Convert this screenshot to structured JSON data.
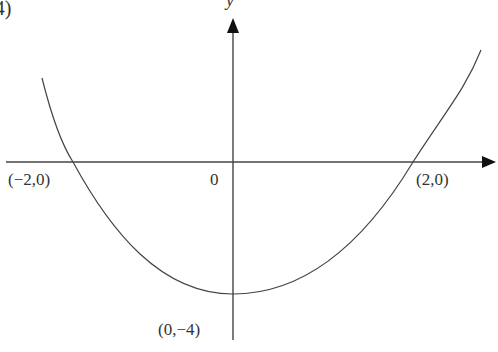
{
  "figure": {
    "part_label": "(4)",
    "y_axis_label": "y",
    "origin_label": "0",
    "points": [
      {
        "label": "(−2,0)",
        "x": -2,
        "y": 0
      },
      {
        "label": "(2,0)",
        "x": 2,
        "y": 0
      },
      {
        "label": "(0,−4)",
        "x": 0,
        "y": -4
      }
    ],
    "curve": "parabola opening upward, roots at x=−2 and x=2, vertex at (0,−4)",
    "line_color": "#333333"
  }
}
